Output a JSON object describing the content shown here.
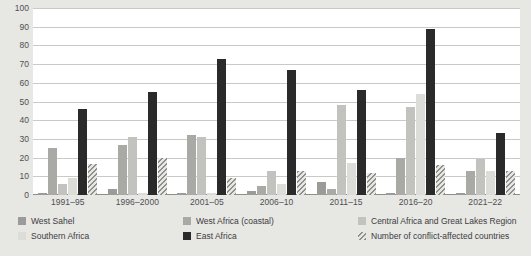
{
  "chart_data": {
    "type": "bar",
    "title": "",
    "subtitle": "",
    "xlabel": "",
    "ylabel": "",
    "ylim": [
      0,
      100
    ],
    "yticks": [
      0,
      10,
      20,
      30,
      40,
      50,
      60,
      70,
      80,
      90,
      100
    ],
    "grid": true,
    "legend_position": "bottom",
    "categories": [
      "1991–95",
      "1996–2000",
      "2001–05",
      "2006–10",
      "2011–15",
      "2016–20",
      "2021–22"
    ],
    "series": [
      {
        "name": "West Sahel",
        "color": "#9b9b99",
        "values": [
          1,
          3,
          1,
          2,
          7,
          1,
          1
        ]
      },
      {
        "name": "West Africa (coastal)",
        "color": "#a9a9a6",
        "values": [
          25,
          27,
          32,
          5,
          3,
          20,
          13
        ]
      },
      {
        "name": "Central Africa and Great Lakes Region",
        "color": "#c2c2bf",
        "values": [
          6,
          31,
          31,
          13,
          48,
          47,
          19
        ]
      },
      {
        "name": "Southern Africa",
        "color": "#dcdcd9",
        "values": [
          9,
          1,
          1,
          6,
          17,
          54,
          13
        ]
      },
      {
        "name": "East Africa",
        "color": "#2a2a2a",
        "values": [
          46,
          55,
          73,
          67,
          56,
          89,
          33
        ]
      },
      {
        "name": "Number of conflict-affected countries",
        "color": "hatched",
        "values": [
          16.5,
          20,
          9,
          13,
          12,
          16,
          13
        ]
      }
    ]
  },
  "legend": {
    "items": [
      {
        "label": "West Sahel",
        "swatch": "s0"
      },
      {
        "label": "West Africa (coastal)",
        "swatch": "s1"
      },
      {
        "label": "Central Africa and Great Lakes Region",
        "swatch": "s2"
      },
      {
        "label": "Southern Africa",
        "swatch": "s3"
      },
      {
        "label": "East Africa",
        "swatch": "s4"
      },
      {
        "label": "Number of conflict-affected countries",
        "swatch": "s5"
      }
    ]
  },
  "axis": {
    "y_labels": [
      "100",
      "90",
      "80",
      "70",
      "60",
      "50",
      "40",
      "30",
      "20",
      "10",
      "0"
    ],
    "x_labels": [
      "1991–95",
      "1996–2000",
      "2001–05",
      "2006–10",
      "2011–15",
      "2016–20",
      "2021–22"
    ]
  },
  "colors": {
    "background": "#e7e7e4",
    "plot_background": "#ffffff",
    "gridline": "#c9c9c6",
    "text": "#4f4f51"
  }
}
